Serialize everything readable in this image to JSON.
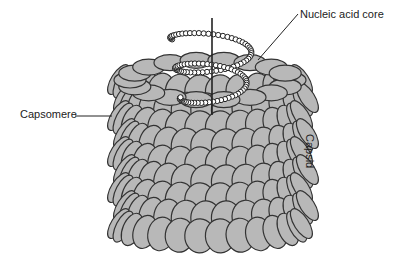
{
  "diagram": {
    "labels": {
      "nucleic_acid_core": "Nucleic acid core",
      "capsomere": "Capsomere",
      "capsid": "Capsid"
    },
    "colors": {
      "capsomere_fill": "#b8b8b8",
      "outline": "#333333",
      "background": "#ffffff"
    }
  }
}
